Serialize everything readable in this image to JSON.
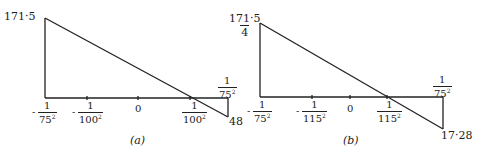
{
  "diagrams": [
    {
      "id": "a",
      "caption": "(a)",
      "top_value": "171·5",
      "bottom_value": "48",
      "top_right_fraction": {
        "num": "1",
        "den": "75",
        "exp": "2"
      },
      "ticks": [
        {
          "sign": "-",
          "num": "1",
          "den": "75",
          "exp": "2"
        },
        {
          "sign": "-",
          "num": "1",
          "den": "100",
          "exp": "2"
        },
        {
          "label": "0"
        },
        {
          "sign": "",
          "num": "1",
          "den": "100",
          "exp": "2"
        }
      ]
    },
    {
      "id": "b",
      "caption": "(b)",
      "top_value": {
        "num": "171·5",
        "den": "4"
      },
      "bottom_value": "17·28",
      "top_right_fraction": {
        "num": "1",
        "den": "75",
        "exp": "2"
      },
      "ticks": [
        {
          "sign": "-",
          "num": "1",
          "den": "75",
          "exp": "2"
        },
        {
          "sign": "-",
          "num": "1",
          "den": "115",
          "exp": "2"
        },
        {
          "label": "0"
        },
        {
          "sign": "",
          "num": "1",
          "den": "115",
          "exp": "2"
        }
      ]
    }
  ],
  "colors": {
    "line": "#222222",
    "background": "#ffffff"
  }
}
